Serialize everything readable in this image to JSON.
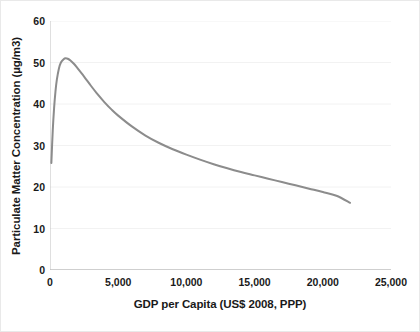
{
  "chart_data": {
    "type": "line",
    "title": "",
    "xlabel": "GDP per Capita (US$ 2008, PPP)",
    "ylabel": "Particulate Matter Concentration (µg/m3)",
    "xlim": [
      0,
      25000
    ],
    "ylim": [
      0,
      60
    ],
    "grid": "horizontal",
    "legend": "none",
    "line_color": "#8c8c8c",
    "line_width": 2,
    "x_ticks": [
      0,
      5000,
      10000,
      15000,
      20000,
      25000
    ],
    "x_tick_labels": [
      "0",
      "5,000",
      "10,000",
      "15,000",
      "20,000",
      "25,000"
    ],
    "y_ticks": [
      0,
      10,
      20,
      30,
      40,
      50,
      60
    ],
    "y_tick_labels": [
      "0",
      "10",
      "20",
      "30",
      "40",
      "50",
      "60"
    ],
    "series": [
      {
        "name": "Particulate matter concentration",
        "x": [
          100,
          200,
          300,
          400,
          500,
          650,
          800,
          1000,
          1150,
          1300,
          1500,
          1750,
          2000,
          2500,
          3000,
          3500,
          4000,
          4500,
          5000,
          6000,
          7000,
          8000,
          9000,
          10000,
          11000,
          12000,
          13000,
          14000,
          15000,
          16000,
          17000,
          18000,
          19000,
          20000,
          21000,
          22000
        ],
        "y": [
          25.8,
          33.5,
          39.0,
          43.0,
          45.8,
          48.5,
          50.0,
          50.8,
          51.0,
          50.9,
          50.5,
          49.7,
          48.7,
          46.6,
          44.4,
          42.3,
          40.4,
          38.7,
          37.2,
          34.6,
          32.4,
          30.6,
          29.1,
          27.8,
          26.6,
          25.5,
          24.5,
          23.6,
          22.8,
          22.0,
          21.2,
          20.4,
          19.6,
          18.8,
          17.9,
          16.2
        ]
      }
    ]
  }
}
